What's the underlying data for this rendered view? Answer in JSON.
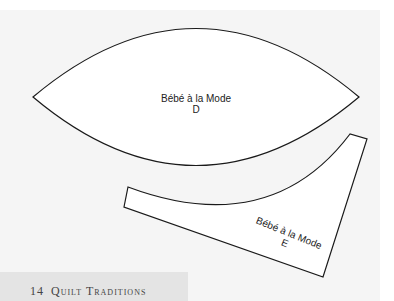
{
  "pattern_pieces": [
    {
      "id": "D",
      "title": "Bébé à la Mode",
      "letter": "D"
    },
    {
      "id": "E",
      "title": "Bébé à la Mode",
      "letter": "E"
    }
  ],
  "footer": {
    "page_number": "14",
    "book_title": "Quilt Traditions"
  },
  "colors": {
    "page_bg": "#f5f5f5",
    "outline": "#1a1a1a",
    "footer_band": "#e4e4e4"
  }
}
